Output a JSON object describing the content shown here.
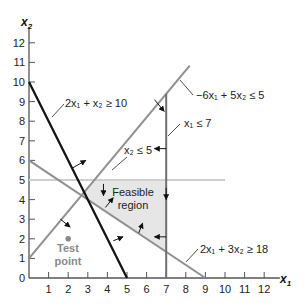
{
  "chart_data": {
    "type": "line",
    "title": "",
    "xlabel": "x1",
    "ylabel": "x2",
    "xlim": [
      0,
      13
    ],
    "ylim": [
      0,
      13
    ],
    "x_ticks": [
      1,
      2,
      3,
      4,
      5,
      6,
      7,
      8,
      9,
      10,
      11,
      12
    ],
    "y_ticks": [
      0,
      1,
      2,
      3,
      4,
      5,
      6,
      7,
      8,
      9,
      10,
      11,
      12
    ],
    "grid": false,
    "constraints": [
      {
        "label": "2x1 + x2 ≥ 10",
        "line": [
          [
            0,
            10
          ],
          [
            5,
            0
          ]
        ],
        "color": "#111111"
      },
      {
        "label": "−6x1 + 5x2 ≤ 5",
        "line": [
          [
            0,
            1
          ],
          [
            8.2,
            10.84
          ]
        ],
        "color": "#8f8f8f"
      },
      {
        "label": "x1 ≤ 7",
        "line": [
          [
            7,
            0
          ],
          [
            7,
            9.4
          ]
        ],
        "color": "#6f6f6f"
      },
      {
        "label": "x2 ≤ 5",
        "line": [
          [
            0,
            5
          ],
          [
            10,
            5
          ]
        ],
        "color": "#cfcfcf"
      },
      {
        "label": "2x1 + 3x2 ≥ 18",
        "line": [
          [
            0,
            6
          ],
          [
            9,
            0
          ]
        ],
        "color": "#8f8f8f"
      }
    ],
    "feasible_region": {
      "label": "Feasible region",
      "vertices": [
        [
          2.8125,
          4.375
        ],
        [
          3.333,
          5
        ],
        [
          7,
          5
        ],
        [
          7,
          1.333
        ],
        [
          3,
          4
        ]
      ]
    },
    "test_point": {
      "label": "Test point",
      "x": 2,
      "y": 2
    }
  },
  "labels": {
    "x_axis": "x",
    "x_axis_sub": "1",
    "y_axis": "x",
    "y_axis_sub": "2",
    "c1": "2x₁ + x₂ ≥ 10",
    "c2": "−6x₁ + 5x₂ ≤ 5",
    "c3": "x₁ ≤ 7",
    "c4": "x₂ ≤ 5",
    "c5": "2x₁ + 3x₂ ≥ 18",
    "region_line1": "Feasible",
    "region_line2": "region",
    "test_line1": "Test",
    "test_line2": "point"
  }
}
